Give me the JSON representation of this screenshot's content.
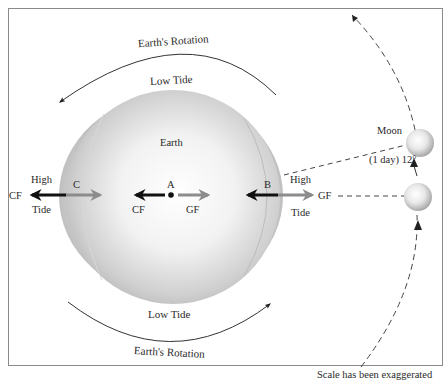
{
  "diagram": {
    "title_top_rotation": "Earth's Rotation",
    "title_bottom_rotation": "Earth's Rotation",
    "low_tide_top": "Low Tide",
    "low_tide_bottom": "Low Tide",
    "earth_label": "Earth",
    "points": {
      "a": "A",
      "b": "B",
      "c": "C"
    },
    "left_high_tide": {
      "line1": "High",
      "line2": "Tide"
    },
    "right_high_tide": {
      "line1": "High",
      "line2": "Tide"
    },
    "forces": {
      "cf_left_outer": "CF",
      "cf_center": "CF",
      "gf_center": "GF",
      "gf_right": "GF"
    },
    "moon_label": "Moon",
    "moon_motion_label": "(1 day) 12°",
    "footnote": "Scale has been exaggerated",
    "colors": {
      "frame": "#8a8a8a",
      "cf_arrow": "#111111",
      "gf_arrow": "#8c8c8c",
      "earth_light": "#ffffff",
      "earth_dark": "#a9a9a9",
      "line": "#333333"
    }
  }
}
